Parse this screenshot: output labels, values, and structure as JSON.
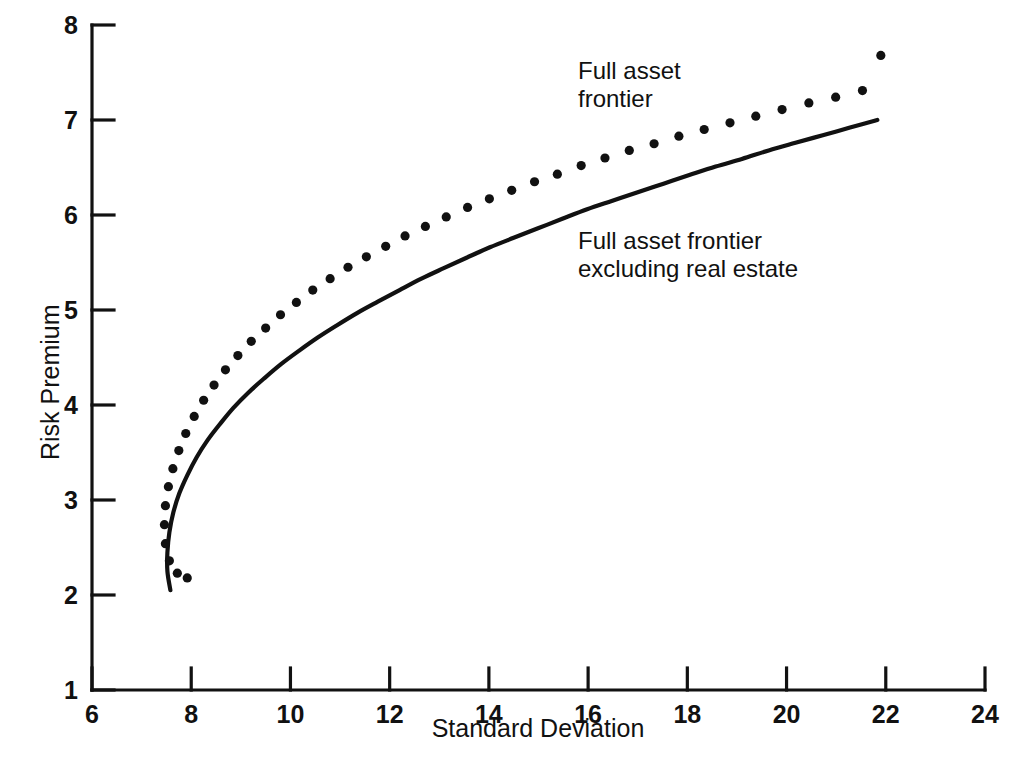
{
  "chart_data": {
    "type": "line",
    "title": "",
    "xlabel": "Standard Deviation",
    "ylabel": "Risk Premium",
    "xlim": [
      6,
      24
    ],
    "ylim": [
      1,
      8
    ],
    "xticks": [
      6,
      8,
      10,
      12,
      14,
      16,
      18,
      20,
      22,
      24
    ],
    "yticks": [
      1,
      2,
      3,
      4,
      5,
      6,
      7,
      8
    ],
    "xtick_labels": [
      "6",
      "8",
      "10",
      "12",
      "14",
      "16",
      "18",
      "20",
      "22",
      "24"
    ],
    "ytick_labels": [
      "1",
      "2",
      "3",
      "4",
      "5",
      "6",
      "7",
      "8"
    ],
    "grid": false,
    "legend_position": "inline-annotations",
    "line_color": "#111111",
    "background_color": "#ffffff",
    "series": [
      {
        "name": "Full asset frontier",
        "style": "dotted",
        "marker": "circle",
        "points": [
          [
            7.92,
            2.18
          ],
          [
            7.72,
            2.23
          ],
          [
            7.56,
            2.36
          ],
          [
            7.48,
            2.54
          ],
          [
            7.46,
            2.74
          ],
          [
            7.48,
            2.94
          ],
          [
            7.54,
            3.14
          ],
          [
            7.63,
            3.33
          ],
          [
            7.75,
            3.52
          ],
          [
            7.89,
            3.7
          ],
          [
            8.06,
            3.88
          ],
          [
            8.25,
            4.05
          ],
          [
            8.46,
            4.21
          ],
          [
            8.69,
            4.37
          ],
          [
            8.94,
            4.52
          ],
          [
            9.21,
            4.67
          ],
          [
            9.5,
            4.81
          ],
          [
            9.8,
            4.95
          ],
          [
            10.12,
            5.08
          ],
          [
            10.45,
            5.21
          ],
          [
            10.8,
            5.33
          ],
          [
            11.16,
            5.45
          ],
          [
            11.53,
            5.56
          ],
          [
            11.92,
            5.67
          ],
          [
            12.31,
            5.78
          ],
          [
            12.72,
            5.88
          ],
          [
            13.14,
            5.98
          ],
          [
            13.57,
            6.08
          ],
          [
            14.01,
            6.17
          ],
          [
            14.46,
            6.26
          ],
          [
            14.92,
            6.35
          ],
          [
            15.38,
            6.43
          ],
          [
            15.86,
            6.52
          ],
          [
            16.34,
            6.6
          ],
          [
            16.83,
            6.68
          ],
          [
            17.33,
            6.75
          ],
          [
            17.83,
            6.83
          ],
          [
            18.34,
            6.9
          ],
          [
            18.86,
            6.97
          ],
          [
            19.38,
            7.04
          ],
          [
            19.91,
            7.11
          ],
          [
            20.45,
            7.18
          ],
          [
            20.99,
            7.24
          ],
          [
            21.53,
            7.31
          ],
          [
            21.9,
            7.68
          ]
        ]
      },
      {
        "name": "Full asset frontier excluding real estate",
        "style": "solid",
        "marker": "none",
        "points": [
          [
            7.58,
            2.05
          ],
          [
            7.52,
            2.25
          ],
          [
            7.52,
            2.45
          ],
          [
            7.56,
            2.66
          ],
          [
            7.64,
            2.87
          ],
          [
            7.76,
            3.07
          ],
          [
            7.92,
            3.26
          ],
          [
            8.11,
            3.45
          ],
          [
            8.33,
            3.63
          ],
          [
            8.58,
            3.8
          ],
          [
            8.85,
            3.97
          ],
          [
            9.15,
            4.13
          ],
          [
            9.47,
            4.28
          ],
          [
            9.81,
            4.43
          ],
          [
            10.17,
            4.57
          ],
          [
            10.55,
            4.71
          ],
          [
            10.94,
            4.84
          ],
          [
            11.35,
            4.97
          ],
          [
            11.77,
            5.09
          ],
          [
            12.2,
            5.21
          ],
          [
            12.64,
            5.33
          ],
          [
            13.09,
            5.44
          ],
          [
            13.55,
            5.55
          ],
          [
            14.02,
            5.66
          ],
          [
            14.5,
            5.76
          ],
          [
            14.99,
            5.86
          ],
          [
            15.48,
            5.96
          ],
          [
            15.98,
            6.06
          ],
          [
            16.49,
            6.15
          ],
          [
            17.0,
            6.24
          ],
          [
            17.52,
            6.33
          ],
          [
            18.04,
            6.42
          ],
          [
            18.57,
            6.51
          ],
          [
            19.1,
            6.59
          ],
          [
            19.64,
            6.68
          ],
          [
            20.18,
            6.76
          ],
          [
            20.73,
            6.84
          ],
          [
            21.28,
            6.92
          ],
          [
            21.83,
            7.0
          ],
          [
            21.92,
            7.66
          ]
        ]
      }
    ],
    "annotations": [
      {
        "id": "annotation-full-asset-frontier",
        "text": "Full asset\nfrontier",
        "line1": "Full asset",
        "line2": "frontier",
        "x": 15.6,
        "y": 7.55
      },
      {
        "id": "annotation-excluding-real-estate",
        "text": "Full asset frontier\nexcluding real estate",
        "line1": "Full asset frontier",
        "line2": "excluding real estate",
        "x": 15.6,
        "y": 5.85
      }
    ]
  }
}
